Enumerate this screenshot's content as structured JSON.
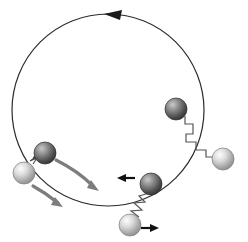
{
  "figure": {
    "background_color": "#ffffff",
    "width": 248,
    "height": 242
  },
  "ring": {
    "name": "circular-track",
    "center_x": 108,
    "center_y": 110,
    "radius": 96,
    "stroke_color": "#2b2b2b",
    "stroke_width": 1.2,
    "rotation_direction": "counterclockwise",
    "arrow_head": {
      "tip_x": 104,
      "tip_y": 14,
      "color": "#1a1a1a",
      "points": "104,14 122,10 120,20"
    }
  },
  "spheres": [
    {
      "name": "left-dark-sphere",
      "shade": "dark",
      "cx": 45,
      "cy": 153,
      "r": 11,
      "color_light": "#b9b9b9",
      "color_mid": "#6e6e6e",
      "color_dark": "#3a3a3a"
    },
    {
      "name": "left-light-sphere",
      "shade": "light",
      "cx": 24,
      "cy": 173,
      "r": 11,
      "color_light": "#f2f2f2",
      "color_mid": "#c8c8c8",
      "color_dark": "#8a8a8a"
    },
    {
      "name": "right-dark-sphere",
      "shade": "dark",
      "cx": 176,
      "cy": 109,
      "r": 11,
      "color_light": "#b9b9b9",
      "color_mid": "#6e6e6e",
      "color_dark": "#3a3a3a"
    },
    {
      "name": "right-light-sphere",
      "shade": "light",
      "cx": 223,
      "cy": 159,
      "r": 11,
      "color_light": "#f2f2f2",
      "color_mid": "#c8c8c8",
      "color_dark": "#8a8a8a"
    },
    {
      "name": "bottom-dark-sphere",
      "shade": "dark",
      "cx": 151,
      "cy": 184,
      "r": 11,
      "color_light": "#b9b9b9",
      "color_mid": "#6e6e6e",
      "color_dark": "#3a3a3a"
    },
    {
      "name": "bottom-light-sphere",
      "shade": "light",
      "cx": 130,
      "cy": 225,
      "r": 11,
      "color_light": "#f2f2f2",
      "color_mid": "#c8c8c8",
      "color_dark": "#8a8a8a"
    }
  ],
  "springs": [
    {
      "name": "left-spring",
      "state": "compressed",
      "stroke_color": "#4a4a4a",
      "stroke_width": 1.1,
      "path": "M33,164 L37,158 L30,161 L40,154 L33,158 L40,152"
    },
    {
      "name": "right-spring",
      "state": "stretched",
      "stroke_color": "#555555",
      "stroke_width": 1.2,
      "path": "M185,116 L185,124 L193,124 L193,134 L186,134 L186,142 L196,142 L196,150 L206,150 L206,157 L214,157"
    },
    {
      "name": "bottom-spring",
      "state": "stretched",
      "stroke_color": "#555555",
      "stroke_width": 1.2,
      "path": "M146,194 L139,196 L145,202 L134,203 L142,210 L131,211 L139,217"
    }
  ],
  "arrows": [
    {
      "name": "velocity-arrow-bottom-dark",
      "direction": "left",
      "color": "#111111",
      "line": {
        "x1": 135,
        "y1": 178,
        "x2": 122,
        "y2": 178
      },
      "head": "117,178 126,174 126,182"
    },
    {
      "name": "velocity-arrow-bottom-light",
      "direction": "right",
      "color": "#111111",
      "line": {
        "x1": 141,
        "y1": 228,
        "x2": 154,
        "y2": 228
      },
      "head": "159,228 150,224 150,232"
    },
    {
      "name": "motion-arrow-upper-gray",
      "direction": "down-right-curved",
      "color": "#7d7d7d",
      "path": "M56,160 C72,168 84,177 93,186",
      "head": "99,191 87,188 91,180"
    },
    {
      "name": "motion-arrow-lower-gray",
      "direction": "down-right-curved",
      "color": "#7d7d7d",
      "path": "M33,186 C44,192 52,198 58,203",
      "head": "63,207 51,205 55,197"
    }
  ]
}
